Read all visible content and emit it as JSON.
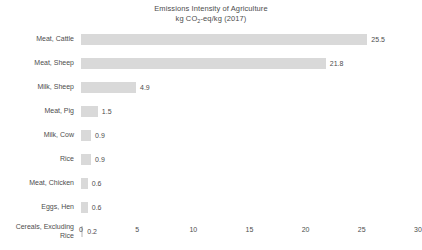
{
  "chart_data": {
    "type": "bar",
    "orientation": "horizontal",
    "title": "Emissions Intensity of Agriculture",
    "subtitle_prefix": "kg CO",
    "subtitle_sub": "2",
    "subtitle_suffix": "-eq/kg (2017)",
    "xlabel": "",
    "ylabel": "",
    "xlim": [
      0,
      30
    ],
    "grid": false,
    "legend": false,
    "bar_color": "#d9d9d9",
    "text_color": "#4d4d4d",
    "background": "#ffffff",
    "categories": [
      "Meat, Cattle",
      "Meat, Sheep",
      "Milk, Sheep",
      "Meat, Pig",
      "Milk, Cow",
      "Rice",
      "Meat, Chicken",
      "Eggs, Hen",
      "Cereals, Excluding\nRice"
    ],
    "values": [
      25.5,
      21.8,
      4.9,
      1.5,
      0.9,
      0.9,
      0.6,
      0.6,
      0.2
    ],
    "value_labels": [
      "25.5",
      "21.8",
      "4.9",
      "1.5",
      "0.9",
      "0.9",
      "0.6",
      "0.6",
      "0.2"
    ],
    "xticks": [
      0,
      5,
      10,
      15,
      20,
      25,
      30
    ],
    "xtick_labels": [
      "0",
      "5",
      "10",
      "15",
      "20",
      "25",
      "30"
    ]
  }
}
